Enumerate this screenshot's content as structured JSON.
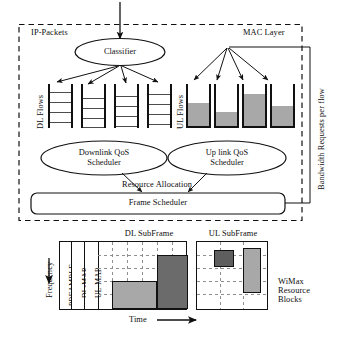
{
  "figure": {
    "type": "block-diagram"
  },
  "mac_box": {
    "left_label": "IP-Packets",
    "right_label": "MAC Layer",
    "side_label": "Bandwidth Requests per flow"
  },
  "classifier": {
    "label": "Classifier",
    "input_arrow": "ip-packet-input"
  },
  "downlink": {
    "flows_label": "DL Flows",
    "scheduler_label_line1": "Downlink QoS",
    "scheduler_label_line2": "Scheduler",
    "queues": [
      {
        "name": "dl-queue-1",
        "segments": 4
      },
      {
        "name": "dl-queue-2",
        "segments": 4
      },
      {
        "name": "dl-queue-3",
        "segments": 4
      },
      {
        "name": "dl-queue-4",
        "segments": 4
      }
    ]
  },
  "uplink": {
    "flows_label": "UL Flows",
    "scheduler_label_line1": "Up link QoS",
    "scheduler_label_line2": "Scheduler",
    "buckets": [
      {
        "name": "ul-bucket-1",
        "fill_percent": 58
      },
      {
        "name": "ul-bucket-2",
        "fill_percent": 35
      },
      {
        "name": "ul-bucket-3",
        "fill_percent": 78
      },
      {
        "name": "ul-bucket-4",
        "fill_percent": 50
      }
    ]
  },
  "resource_allocation": {
    "label": "Resource Allocation"
  },
  "frame_scheduler": {
    "label": "Frame Scheduler"
  },
  "frame_structure": {
    "dl_subframe_label": "DL SubFrame",
    "ul_subframe_label": "UL SubFrame",
    "frequency_axis_label": "Frequency",
    "time_axis_label": "Time",
    "right_label_lines": [
      "WiMax",
      "Resource",
      "Blocks"
    ],
    "control_columns": [
      "PREAMBLE",
      "DL-MAP",
      "UL-MAP"
    ],
    "dl_grid": {
      "cols": 6,
      "rows": 5
    },
    "ul_grid": {
      "cols": 3,
      "rows": 5
    },
    "dl_blocks": [
      {
        "name": "dl-block-light",
        "col": 1,
        "col_span": 2,
        "row": 2,
        "row_span": 3,
        "color": "#a8a8a8"
      },
      {
        "name": "dl-block-dark",
        "col": 4,
        "col_span": 1.4,
        "row": 0.7,
        "row_span": 4.3,
        "color": "#6b6b6b"
      }
    ],
    "ul_blocks": [
      {
        "name": "ul-block-dark",
        "col": 0.7,
        "col_span": 0.9,
        "row": 0.6,
        "row_span": 1.2,
        "color": "#5e5e5e"
      },
      {
        "name": "ul-block-light",
        "col": 1.95,
        "col_span": 0.85,
        "row": 0.5,
        "row_span": 3.4,
        "color": "#a8a8a8"
      }
    ]
  },
  "colors": {
    "stroke": "#111111",
    "light_block": "#a8a8a8",
    "dark_block": "#6b6b6b",
    "ul_dark_block": "#5e5e5e",
    "grid_line": "#9a9a9a",
    "dashed_border": "#111111"
  }
}
